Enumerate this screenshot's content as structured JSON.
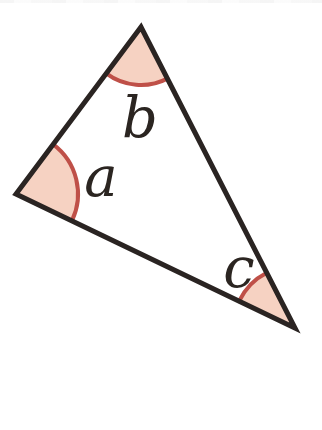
{
  "figure": {
    "background_color": "#ffffff",
    "triangle": {
      "outline_color": "#2a2422",
      "outline_width": 5,
      "vertices": [
        {
          "name": "top",
          "x": 141,
          "y": 27
        },
        {
          "name": "left",
          "x": 16,
          "y": 194
        },
        {
          "name": "bottom-right",
          "x": 295,
          "y": 328
        }
      ]
    },
    "angle_marker_style": {
      "fill_color": "#f6d2c2",
      "arc_color": "#bf5048",
      "arc_width": 4
    },
    "angles": [
      {
        "label": "a",
        "vertex_index": 1,
        "radius": 62,
        "label_x": 101,
        "label_y": 177
      },
      {
        "label": "b",
        "vertex_index": 0,
        "radius": 58,
        "label_x": 140,
        "label_y": 118
      },
      {
        "label": "c",
        "vertex_index": 2,
        "radius": 62,
        "label_x": 239,
        "label_y": 268
      }
    ],
    "label_color": "#2b2521"
  }
}
